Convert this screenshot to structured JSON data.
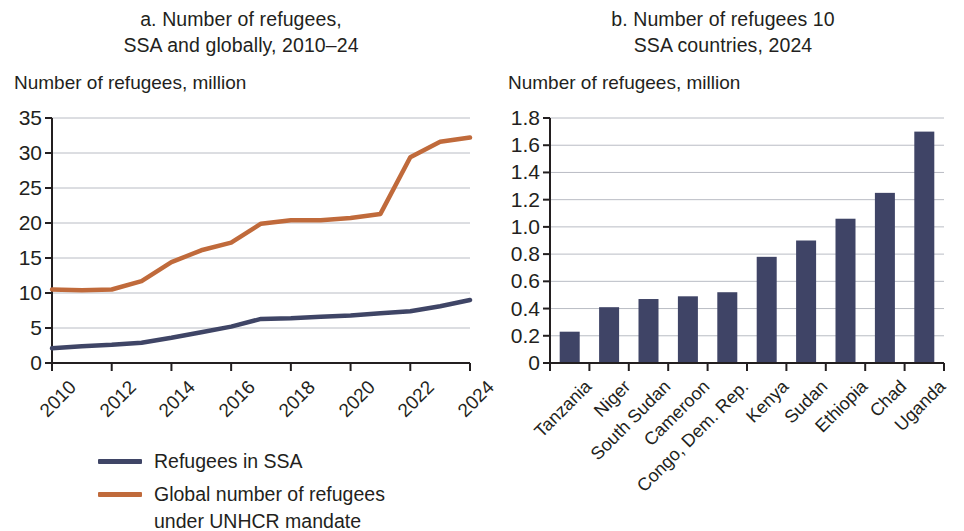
{
  "panel_a": {
    "title_line1": "a. Number of refugees,",
    "title_line2": "SSA and globally, 2010–24",
    "axis_label": "Number of refugees, million",
    "legend": [
      {
        "label": "Refugees in SSA",
        "label2": "",
        "color": "#3f4566"
      },
      {
        "label": "Global number of refugees",
        "label2": "under UNHCR mandate",
        "color": "#c06a3b"
      }
    ]
  },
  "panel_b": {
    "title_line1": "b. Number of refugees 10",
    "title_line2": "SSA countries, 2024",
    "axis_label": "Number of refugees, million"
  },
  "chart_data": [
    {
      "type": "line",
      "title": "a. Number of refugees, SSA and globally, 2010–24",
      "xlabel": "",
      "ylabel": "Number of refugees, million",
      "ylim": [
        0,
        35
      ],
      "yticks": [
        "0",
        "5",
        "10",
        "15",
        "20",
        "25",
        "30",
        "35"
      ],
      "ytick_values": [
        0,
        5,
        10,
        15,
        20,
        25,
        30,
        35
      ],
      "xlim": [
        2010,
        2024
      ],
      "x": [
        2010,
        2011,
        2012,
        2013,
        2014,
        2015,
        2016,
        2017,
        2018,
        2019,
        2020,
        2021,
        2022,
        2023,
        2024
      ],
      "xtick_labels": [
        "2010",
        "2012",
        "2014",
        "2016",
        "2018",
        "2020",
        "2022",
        "2024"
      ],
      "xtick_values": [
        2010,
        2012,
        2014,
        2016,
        2018,
        2020,
        2022,
        2024
      ],
      "grid": true,
      "legend_position": "below",
      "series": [
        {
          "name": "Refugees in SSA",
          "color": "#3f4566",
          "values": [
            2.1,
            2.4,
            2.6,
            2.9,
            3.6,
            4.4,
            5.2,
            6.3,
            6.4,
            6.6,
            6.8,
            7.1,
            7.4,
            8.1,
            9.0
          ]
        },
        {
          "name": "Global number of refugees under UNHCR mandate",
          "color": "#c06a3b",
          "values": [
            10.5,
            10.4,
            10.5,
            11.7,
            14.4,
            16.1,
            17.2,
            19.9,
            20.4,
            20.4,
            20.7,
            21.3,
            29.4,
            31.6,
            32.2
          ]
        }
      ]
    },
    {
      "type": "bar",
      "title": "b. Number of refugees 10 SSA countries, 2024",
      "xlabel": "",
      "ylabel": "Number of refugees, million",
      "ylim": [
        0,
        1.8
      ],
      "yticks": [
        "0",
        "0.2",
        "0.4",
        "0.6",
        "0.8",
        "1.0",
        "1.2",
        "1.4",
        "1.6",
        "1.8"
      ],
      "ytick_values": [
        0,
        0.2,
        0.4,
        0.6,
        0.8,
        1.0,
        1.2,
        1.4,
        1.6,
        1.8
      ],
      "grid": true,
      "bar_color": "#3f4466",
      "categories": [
        "Tanzania",
        "Niger",
        "South Sudan",
        "Cameroon",
        "Congo, Dem. Rep.",
        "Kenya",
        "Sudan",
        "Ethiopia",
        "Chad",
        "Uganda"
      ],
      "values": [
        0.23,
        0.41,
        0.47,
        0.49,
        0.52,
        0.78,
        0.9,
        1.06,
        1.25,
        1.7
      ]
    }
  ]
}
